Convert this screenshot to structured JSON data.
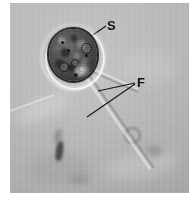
{
  "figure": {
    "kind": "light-micrograph",
    "background_color": "#b3b3b3",
    "plate_border_color": "#8c8c8c",
    "label_color": "#121212"
  },
  "labels": [
    {
      "id": "S",
      "text": "S",
      "meaning": "cell body / stigma",
      "x": 107,
      "y": 24,
      "leader": {
        "from_x": 106,
        "from_y": 32,
        "to_x": 85,
        "to_y": 46
      }
    },
    {
      "id": "F",
      "text": "F",
      "meaning": "flagella",
      "x": 138,
      "y": 80,
      "leaders": [
        {
          "from_x": 136,
          "from_y": 87,
          "to_x": 100,
          "to_y": 96
        },
        {
          "from_x": 136,
          "from_y": 88,
          "to_x": 88,
          "to_y": 121
        }
      ]
    }
  ],
  "cell": {
    "center_x": 63,
    "center_y": 52,
    "width": 48,
    "height": 52,
    "body_color": "#3c3c3c",
    "rim_color": "#2a2a2a",
    "halo_color": "#ffffff"
  },
  "flagella": [
    {
      "name": "flagellum-upper",
      "x1": 86,
      "y1": 79,
      "x2": 132,
      "y2": 99
    },
    {
      "name": "flagellum-lower",
      "x1": 84,
      "y1": 82,
      "x2": 146,
      "y2": 172
    }
  ],
  "debris": [
    {
      "name": "debris-rod",
      "x": 60,
      "y": 152
    },
    {
      "name": "debris-ring",
      "x": 128,
      "y": 138
    },
    {
      "name": "debris-blob",
      "x": 150,
      "y": 156
    },
    {
      "name": "debris-streak",
      "x": 28,
      "y": 124
    }
  ]
}
